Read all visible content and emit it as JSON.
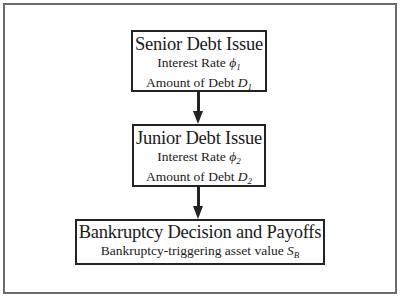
{
  "diagram": {
    "type": "flowchart",
    "direction": "top-to-bottom",
    "nodes": [
      {
        "id": "senior",
        "title": "Senior Debt Issue",
        "lines": [
          {
            "text": "Interest Rate ",
            "symbol": "ϕ",
            "subscript": "1"
          },
          {
            "text": "Amount of Debt ",
            "symbol": "D",
            "subscript": "1"
          }
        ]
      },
      {
        "id": "junior",
        "title": "Junior Debt Issue",
        "lines": [
          {
            "text": "Interest Rate ",
            "symbol": "ϕ",
            "subscript": "2"
          },
          {
            "text": "Amount of Debt ",
            "symbol": "D",
            "subscript": "2"
          }
        ]
      },
      {
        "id": "bankruptcy",
        "title": "Bankruptcy Decision and Payoffs",
        "lines": [
          {
            "text": "Bankruptcy-triggering asset value ",
            "symbol": "S",
            "subscript": "B"
          }
        ]
      }
    ],
    "edges": [
      {
        "from": "senior",
        "to": "junior"
      },
      {
        "from": "junior",
        "to": "bankruptcy"
      }
    ],
    "colors": {
      "stroke": "#222222",
      "frame": "#6a6a6a",
      "background": "#ffffff"
    }
  }
}
